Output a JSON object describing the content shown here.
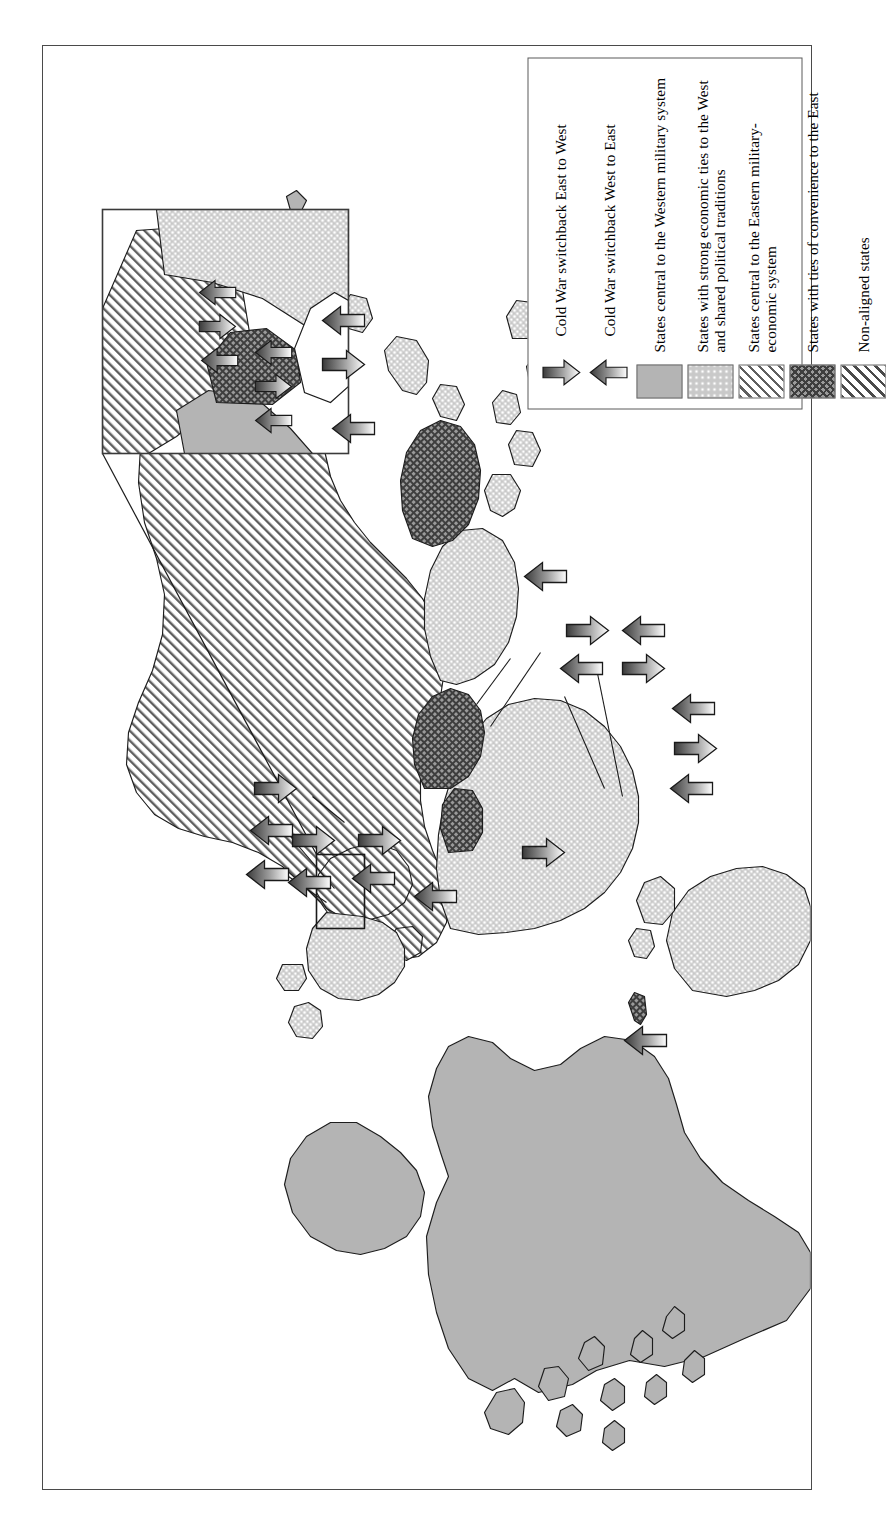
{
  "figure": {
    "domain": "map",
    "orientation": "rotated-90-ccw",
    "background": "#ffffff",
    "frame_color": "#4a4a4a",
    "title": ""
  },
  "legend": {
    "box_border": "#5a5a5a",
    "arrow_entries": [
      {
        "icon": "down-arrow-icon",
        "direction": "down",
        "label": "Cold War switchback East to West"
      },
      {
        "icon": "up-arrow-icon",
        "direction": "up",
        "label": "Cold War switchback West to East"
      }
    ],
    "swatch_entries": [
      {
        "pattern": "solid-gray",
        "color": "#b4b4b4",
        "label": "States central to the Western military system"
      },
      {
        "pattern": "light-dots",
        "color": "#c9c9c9",
        "label": "States with strong economic ties to the West and shared political traditions"
      },
      {
        "pattern": "diagonal-hatch",
        "color": "#5f5f5f",
        "label": "States central to the Eastern military-economic system"
      },
      {
        "pattern": "dark-crosshatch",
        "color": "#3e3e3e",
        "label": "States with ties of convenience to the East"
      },
      {
        "pattern": "diagonal-hatch-2",
        "color": "#4a4a4a",
        "label": "Non-aligned states"
      }
    ]
  },
  "map": {
    "regions": [
      {
        "name": "north-america",
        "pattern": "solid-gray"
      },
      {
        "name": "greenland",
        "pattern": "solid-gray"
      },
      {
        "name": "south-america",
        "pattern": "light-dots"
      },
      {
        "name": "western-europe",
        "pattern": "light-dots"
      },
      {
        "name": "eastern-europe",
        "pattern": "diagonal-hatch"
      },
      {
        "name": "soviet-union",
        "pattern": "diagonal-hatch"
      },
      {
        "name": "africa",
        "pattern": "light-dots"
      },
      {
        "name": "middle-east",
        "pattern": "dark-crosshatch"
      },
      {
        "name": "south-asia",
        "pattern": "light-dots"
      },
      {
        "name": "china",
        "pattern": "dark-crosshatch"
      },
      {
        "name": "india",
        "pattern": "diagonal-hatch-2"
      },
      {
        "name": "southeast-asia",
        "pattern": "light-dots"
      },
      {
        "name": "japan",
        "pattern": "light-dots"
      },
      {
        "name": "australia",
        "pattern": "solid-gray"
      },
      {
        "name": "new-zealand",
        "pattern": "solid-gray"
      },
      {
        "name": "cuba",
        "pattern": "dark-crosshatch"
      }
    ],
    "inset": {
      "name": "central-europe-detail",
      "source_rect": {
        "x": 352,
        "y": 608,
        "w": 48,
        "h": 74
      },
      "arrows_up": 4,
      "arrows_down": 2
    },
    "arrow_clusters": [
      {
        "name": "east-asia",
        "up": 2,
        "down": 1
      },
      {
        "name": "northern-europe",
        "up": 1,
        "down": 0
      },
      {
        "name": "baltic",
        "up": 1,
        "down": 1
      },
      {
        "name": "central-europe",
        "up": 1,
        "down": 1
      },
      {
        "name": "balkans",
        "up": 1,
        "down": 1
      },
      {
        "name": "north-africa",
        "up": 1,
        "down": 0
      },
      {
        "name": "horn-of-africa",
        "up": 0,
        "down": 1
      },
      {
        "name": "middle-east",
        "up": 1,
        "down": 1
      },
      {
        "name": "south-asia",
        "up": 1,
        "down": 1
      },
      {
        "name": "southern-africa",
        "up": 2,
        "down": 1
      },
      {
        "name": "arabian-sea",
        "up": 1,
        "down": 0
      },
      {
        "name": "caribbean",
        "up": 1,
        "down": 0
      }
    ]
  }
}
